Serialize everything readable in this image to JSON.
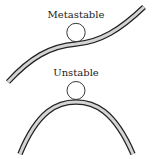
{
  "diagram": {
    "type": "equilibrium-stability-illustration",
    "panels": [
      {
        "label": "Metastable",
        "surface": "s-curve (local flat region with slope)",
        "ball": "circle resting on inflection region"
      },
      {
        "label": "Unstable",
        "surface": "arch (hilltop)",
        "ball": "circle resting on top of arch"
      }
    ],
    "colors": {
      "outline": "#222222",
      "track_fill": "#d4d4d4",
      "ball_fill": "#ffffff",
      "background": "#ffffff"
    }
  }
}
